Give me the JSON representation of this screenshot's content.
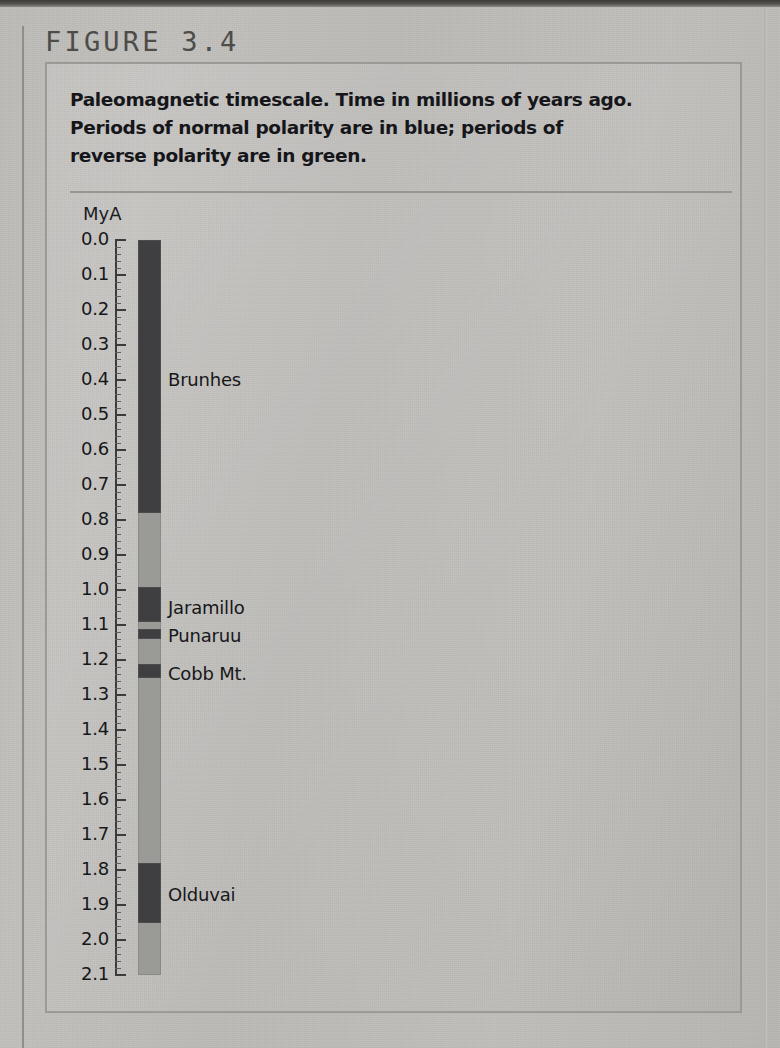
{
  "figure": {
    "label": "FIGURE 3.4",
    "caption_lines": [
      "Paleomagnetic timescale. Time in millions of years ago.",
      "Periods of normal polarity are in blue; periods of",
      "reverse polarity are in green."
    ]
  },
  "chart_data": {
    "type": "bar",
    "title": "Paleomagnetic timescale. Time in millions of years ago. Periods of normal polarity are in blue; periods of reverse polarity are in green.",
    "orientation": "vertical",
    "xlabel": "",
    "ylabel": "MyA",
    "axis_unit_label": "MyA",
    "ylim": [
      0.0,
      2.1
    ],
    "y_inverted": true,
    "grid": false,
    "legend": "none",
    "major_tick_step": 0.1,
    "minor_tick_step": 0.02,
    "tick_labels": [
      "0.0",
      "0.1",
      "0.2",
      "0.3",
      "0.4",
      "0.5",
      "0.6",
      "0.7",
      "0.8",
      "0.9",
      "1.0",
      "1.1",
      "1.2",
      "1.3",
      "1.4",
      "1.5",
      "1.6",
      "1.7",
      "1.8",
      "1.9",
      "2.0",
      "2.1"
    ],
    "tick_values": [
      0.0,
      0.1,
      0.2,
      0.3,
      0.4,
      0.5,
      0.6,
      0.7,
      0.8,
      0.9,
      1.0,
      1.1,
      1.2,
      1.3,
      1.4,
      1.5,
      1.6,
      1.7,
      1.8,
      1.9,
      2.0,
      2.1
    ],
    "colors": {
      "normal_polarity": "#3f3f41",
      "reverse_polarity": "#9a9a97",
      "normal_polarity_described": "blue",
      "reverse_polarity_described": "green"
    },
    "categories": [
      "normal polarity",
      "reverse polarity"
    ],
    "series": [
      {
        "name": "normal polarity",
        "description": "Periods of normal magnetic polarity (shown in blue)",
        "bands": [
          {
            "name": "Brunhes",
            "start": 0.0,
            "end": 0.78,
            "label": "Brunhes",
            "label_at": 0.4
          },
          {
            "name": "Jaramillo",
            "start": 0.99,
            "end": 1.09,
            "label": "Jaramillo",
            "label_at": 1.05
          },
          {
            "name": "Punaruu",
            "start": 1.11,
            "end": 1.14,
            "label": "Punaruu",
            "label_at": 1.13
          },
          {
            "name": "Cobb Mt.",
            "start": 1.21,
            "end": 1.25,
            "label": "Cobb Mt.",
            "label_at": 1.24
          },
          {
            "name": "Olduvai",
            "start": 1.78,
            "end": 1.95,
            "label": "Olduvai",
            "label_at": 1.87
          }
        ]
      },
      {
        "name": "reverse polarity",
        "description": "Periods of reverse magnetic polarity (shown in green)",
        "bands": [
          {
            "name": "Matuyama (0.78-0.99)",
            "start": 0.78,
            "end": 0.99
          },
          {
            "name": "Matuyama (1.09-1.11)",
            "start": 1.09,
            "end": 1.11
          },
          {
            "name": "Matuyama (1.14-1.21)",
            "start": 1.14,
            "end": 1.21
          },
          {
            "name": "Matuyama (1.25-1.78)",
            "start": 1.25,
            "end": 1.78
          },
          {
            "name": "Matuyama (1.95-2.10)",
            "start": 1.95,
            "end": 2.1
          }
        ]
      }
    ],
    "annotations": [
      "Brunhes",
      "Jaramillo",
      "Punaruu",
      "Cobb Mt.",
      "Olduvai"
    ]
  }
}
